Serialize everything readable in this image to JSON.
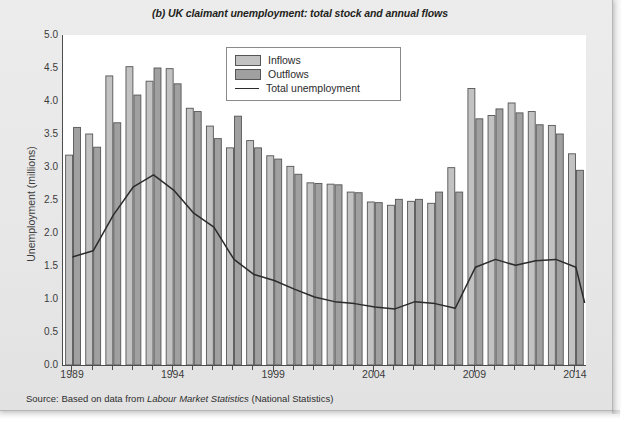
{
  "chart_title": "(b) UK claimant unemployment: total stock and annual flows",
  "source_note": {
    "prefix": "Source: Based on data from ",
    "italic": "Labour Market Statistics",
    "suffix": " (National Statistics)"
  },
  "legend": {
    "items": [
      {
        "label": "Inflows",
        "marker": "swatch",
        "color": "#c2c2c2"
      },
      {
        "label": "Outflows",
        "marker": "swatch",
        "color": "#a0a0a0"
      },
      {
        "label": "Total unemployment",
        "marker": "line",
        "color": "#2b2b2b"
      }
    ]
  },
  "colors": {
    "inflows_fill": "#c2c2c2",
    "outflows_fill": "#a0a0a0",
    "bar_stroke": "#555555",
    "line": "#2b2b2b",
    "axis": "#4d4d4d",
    "plot_background": "#ffffff",
    "page_background": "#e9e9e9"
  },
  "chart_data": {
    "type": "bar",
    "title": "(b) UK claimant unemployment: total stock and annual flows",
    "xlabel": "",
    "ylabel": "Unemployment (millions)",
    "ylim": [
      0.0,
      5.0
    ],
    "ytick_values": [
      0.0,
      0.5,
      1.0,
      1.5,
      2.0,
      2.5,
      3.0,
      3.5,
      4.0,
      4.5,
      5.0
    ],
    "ytick_labels": [
      "0.0",
      "0.5",
      "1.0",
      "1.5",
      "2.0",
      "2.5",
      "3.0",
      "3.5",
      "4.0",
      "4.5",
      "5.0"
    ],
    "xtick_labels": [
      "1989",
      "1994",
      "1999",
      "2004",
      "2009",
      "2014"
    ],
    "xtick_years": [
      1989,
      1994,
      1999,
      2004,
      2009,
      2014
    ],
    "grid": false,
    "legend_position": "upper-center",
    "categories": [
      1989,
      1990,
      1991,
      1992,
      1993,
      1994,
      1995,
      1996,
      1997,
      1998,
      1999,
      2000,
      2001,
      2002,
      2003,
      2004,
      2005,
      2006,
      2007,
      2008,
      2009,
      2010,
      2011,
      2012,
      2013,
      2014
    ],
    "series": [
      {
        "name": "Inflows",
        "type": "bar",
        "color": "#c2c2c2",
        "values": [
          3.18,
          3.5,
          4.38,
          4.52,
          4.3,
          4.49,
          3.89,
          3.62,
          3.29,
          3.4,
          3.17,
          3.01,
          2.76,
          2.74,
          2.62,
          2.47,
          2.42,
          2.48,
          2.45,
          2.99,
          4.19,
          3.78,
          3.97,
          3.84,
          3.63,
          3.2
        ]
      },
      {
        "name": "Outflows",
        "type": "bar",
        "color": "#a0a0a0",
        "values": [
          3.6,
          3.3,
          3.67,
          4.09,
          4.5,
          4.26,
          3.84,
          3.43,
          3.77,
          3.29,
          3.12,
          2.89,
          2.75,
          2.73,
          2.61,
          2.46,
          2.51,
          2.51,
          2.62,
          2.62,
          3.73,
          3.88,
          3.82,
          3.64,
          3.5,
          2.95
        ]
      },
      {
        "name": "Total unemployment",
        "type": "line",
        "color": "#2b2b2b",
        "values": [
          1.64,
          1.73,
          2.27,
          2.7,
          2.88,
          2.65,
          2.3,
          2.09,
          1.6,
          1.37,
          1.28,
          1.15,
          1.03,
          0.96,
          0.93,
          0.88,
          0.85,
          0.96,
          0.93,
          0.86,
          1.48,
          1.6,
          1.51,
          1.58,
          1.6,
          1.48
        ],
        "end_value": 0.95
      }
    ]
  }
}
